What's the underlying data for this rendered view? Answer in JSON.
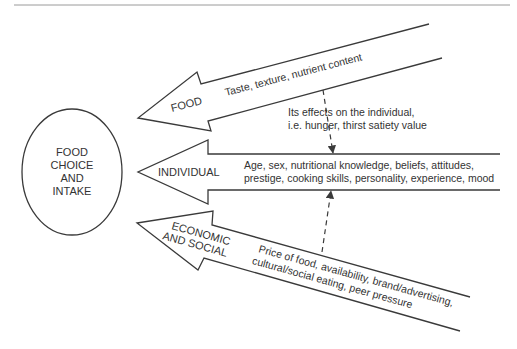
{
  "diagram": {
    "center": {
      "lines": [
        "FOOD",
        "CHOICE",
        "AND",
        "INTAKE"
      ]
    },
    "arrows": [
      {
        "id": "food",
        "label": "FOOD",
        "content": "Taste, texture, nutrient content"
      },
      {
        "id": "individual",
        "label": "INDIVIDUAL",
        "content_lines": [
          "Age, sex, nutritional knowledge, beliefs, attitudes,",
          "prestige, cooking skills, personality, experience, mood"
        ]
      },
      {
        "id": "economic-social",
        "label_lines": [
          "ECONOMIC",
          "AND SOCIAL"
        ],
        "content_lines": [
          "Price of food, availability, brand/advertising,",
          "cultural/social eating, peer pressure"
        ]
      }
    ],
    "annotation": {
      "lines": [
        "Its effects on the individual,",
        "i.e. hunger, thirst satiety value"
      ]
    },
    "colors": {
      "stroke": "#3a3a3a",
      "text": "#333333",
      "rule": "#9a9a9a"
    }
  }
}
